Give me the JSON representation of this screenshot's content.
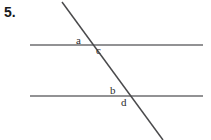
{
  "figure": {
    "problem_number": "5.",
    "background_color": "#ffffff",
    "line_color": "#6e6e70",
    "transversal_color": "#4a4a4c",
    "label_color": "#2b2b2d",
    "number_color": "#19191b"
  },
  "lines": {
    "top_parallel": {
      "name": "top-horizontal-line",
      "x1": 30,
      "y1": 45,
      "x2": 203,
      "y2": 45
    },
    "bottom_parallel": {
      "name": "bottom-horizontal-line",
      "x1": 30,
      "y1": 96,
      "x2": 203,
      "y2": 96
    },
    "transversal": {
      "name": "transversal-line",
      "x1": 62,
      "y1": 2,
      "x2": 163,
      "y2": 140
    }
  },
  "intersections": {
    "top": {
      "x": 90,
      "y": 45
    },
    "bottom": {
      "x": 128,
      "y": 96
    }
  },
  "angle_labels": [
    {
      "id": "a",
      "text": "a",
      "x": 76,
      "y": 35
    },
    {
      "id": "c",
      "text": "c",
      "x": 96,
      "y": 45
    },
    {
      "id": "b",
      "text": "b",
      "x": 110,
      "y": 85
    },
    {
      "id": "d",
      "text": "d",
      "x": 121,
      "y": 97
    }
  ]
}
